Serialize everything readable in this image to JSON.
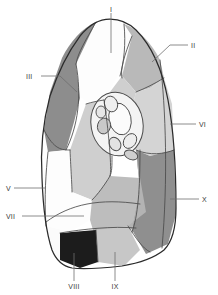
{
  "figure": {
    "type": "anatomical-diagram",
    "background_color": "#ffffff",
    "outline_color": "#2b2b2b",
    "divider_color": "#4a4a4a",
    "leader_color": "#6e6e6e",
    "label_color": "#3a3a3a"
  },
  "labels": [
    {
      "id": "I",
      "text": "I",
      "x": 111,
      "y": 10,
      "anchor": "middle",
      "leader": "M111,13 L111,53"
    },
    {
      "id": "II",
      "text": "II",
      "x": 191,
      "y": 47,
      "anchor": "start",
      "leader": "M188,45 L170,45 L152,62"
    },
    {
      "id": "III",
      "text": "III",
      "x": 28,
      "y": 78,
      "anchor": "start",
      "leader": "M41,76 L60,76 L77,92"
    },
    {
      "id": "VI",
      "text": "VI",
      "x": 199,
      "y": 127,
      "anchor": "start",
      "leader": "M196,124 L170,124"
    },
    {
      "id": "V",
      "text": "V",
      "x": 6,
      "y": 190,
      "anchor": "start",
      "leader": "M14,188 L45,188"
    },
    {
      "id": "VII",
      "text": "VII",
      "x": 6,
      "y": 218,
      "anchor": "start",
      "leader": "M20,216 L84,216"
    },
    {
      "id": "X",
      "text": "X",
      "x": 202,
      "y": 202,
      "anchor": "start",
      "leader": "M199,199 L170,199"
    },
    {
      "id": "VIII",
      "text": "VIII",
      "x": 74,
      "y": 288,
      "anchor": "middle",
      "leader": "M74,281 L74,253"
    },
    {
      "id": "IX",
      "text": "IX",
      "x": 115,
      "y": 288,
      "anchor": "middle",
      "leader": "M115,281 L115,252"
    }
  ],
  "segments": [
    {
      "id": "seg-I",
      "name": "apical-segment",
      "color": "#fdfdfd"
    },
    {
      "id": "seg-II",
      "name": "posterior-segment",
      "color": "#b9b9b9"
    },
    {
      "id": "seg-III",
      "name": "anterior-segment",
      "color": "#8d8d8d"
    },
    {
      "id": "seg-IV",
      "name": "superior-lingular-segment",
      "color": "#cfcfcf"
    },
    {
      "id": "seg-V",
      "name": "inferior-lingular-segment",
      "color": "#fdfdfd"
    },
    {
      "id": "seg-VI",
      "name": "superior-basal-segment",
      "color": "#d4d4d4"
    },
    {
      "id": "seg-VII",
      "name": "medial-basal-segment",
      "color": "#bdbdbd"
    },
    {
      "id": "seg-VIII",
      "name": "anterior-basal-segment",
      "color": "#1c1c1c"
    },
    {
      "id": "seg-IX",
      "name": "lateral-basal-segment",
      "color": "#c7c7c7"
    },
    {
      "id": "seg-X",
      "name": "posterior-basal-segment",
      "color": "#8f8f8f"
    }
  ],
  "hilum": {
    "name": "hilum-vessels",
    "fill": "#f4f4f4",
    "structure_fill": "#c9c9c9",
    "structures": [
      {
        "id": "bronchus",
        "cx": 120,
        "cy": 119,
        "rx": 11,
        "ry": 16,
        "rot": -12
      },
      {
        "id": "upper-vessel",
        "cx": 112,
        "cy": 103,
        "rx": 6.5,
        "ry": 8,
        "rot": -20
      },
      {
        "id": "small-vessel-a",
        "cx": 101,
        "cy": 111,
        "rx": 5,
        "ry": 6,
        "rot": 0
      },
      {
        "id": "small-vessel-b",
        "cx": 104,
        "cy": 125,
        "rx": 6.5,
        "ry": 8,
        "rot": 15
      },
      {
        "id": "lower-vessel",
        "cx": 116,
        "cy": 143,
        "rx": 5.5,
        "ry": 7,
        "rot": -30
      },
      {
        "id": "side-vessel",
        "cx": 129,
        "cy": 141,
        "rx": 6,
        "ry": 8,
        "rot": 35
      },
      {
        "id": "node",
        "cx": 130,
        "cy": 154,
        "rx": 7,
        "ry": 4.5,
        "rot": 20
      }
    ]
  }
}
